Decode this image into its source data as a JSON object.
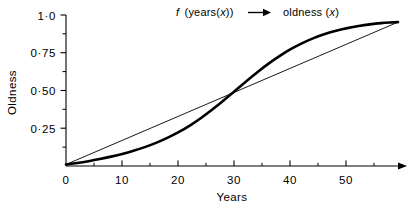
{
  "chart_data": {
    "type": "line",
    "title_parts": {
      "func_italic": "f",
      "func_arg": "(years(",
      "var_italic_1": "x",
      "func_arg_close": "))",
      "arrow": "arrow-right-icon",
      "result": "oldness (",
      "var_italic_2": "x",
      "result_close": ")"
    },
    "xlabel": "Years",
    "ylabel": "Oldness",
    "xlim": [
      0,
      59
    ],
    "ylim": [
      0,
      1.0
    ],
    "grid": false,
    "legend_position": "top-center",
    "xticks": [
      0,
      10,
      20,
      30,
      40,
      50
    ],
    "xtick_labels": [
      "0",
      "10",
      "20",
      "30",
      "40",
      "50"
    ],
    "xminor_ticks": [
      5,
      15,
      25,
      35,
      45,
      55
    ],
    "yticks": [
      0,
      0.25,
      0.5,
      0.75,
      1.0
    ],
    "ytick_labels": [
      "0",
      "0·25",
      "0·50",
      "0·75",
      "1·0"
    ],
    "yminor_ticks": [
      0.125,
      0.375,
      0.625,
      0.875
    ],
    "axis_arrow_x": true,
    "series": [
      {
        "name": "oldness (x)",
        "style": "thick-sigmoid",
        "color": "#000000",
        "linewidth": 2.6,
        "x": [
          0,
          2,
          4,
          6,
          8,
          10,
          12,
          14,
          16,
          18,
          20,
          22,
          24,
          26,
          28,
          30,
          32,
          34,
          36,
          38,
          40,
          42,
          44,
          46,
          48,
          50,
          52,
          54,
          56,
          58,
          59
        ],
        "y": [
          0.01,
          0.02,
          0.032,
          0.046,
          0.062,
          0.08,
          0.101,
          0.125,
          0.153,
          0.186,
          0.224,
          0.268,
          0.318,
          0.374,
          0.434,
          0.497,
          0.56,
          0.621,
          0.678,
          0.729,
          0.775,
          0.814,
          0.847,
          0.874,
          0.896,
          0.913,
          0.927,
          0.938,
          0.946,
          0.951,
          0.953
        ]
      },
      {
        "name": "linear reference",
        "style": "thin-straight",
        "color": "#000000",
        "linewidth": 0.9,
        "x": [
          0,
          59
        ],
        "y": [
          0.01,
          0.953
        ]
      }
    ],
    "annotations": [
      {
        "label": "crossing-point",
        "x": 28,
        "y": 0.445
      }
    ]
  },
  "axes": {
    "x_axis_name": "x-axis",
    "y_axis_name": "y-axis"
  }
}
